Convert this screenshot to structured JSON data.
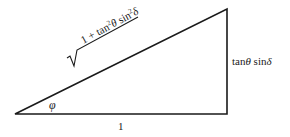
{
  "diagram": {
    "type": "right-triangle",
    "vertices": {
      "left": [
        15,
        114
      ],
      "bottom_right": [
        227,
        114
      ],
      "top_right": [
        227,
        9
      ]
    },
    "stroke_color": "#1a1a1a",
    "labels": {
      "hypotenuse": {
        "radical": "√",
        "part1": "1 + tan",
        "exp1": "2",
        "theta": "θ",
        "part2": " sin",
        "exp2": "2",
        "delta": "δ"
      },
      "opposite": {
        "part1": "tan",
        "theta": "θ",
        "part2": " sin",
        "delta": "δ"
      },
      "adjacent": "1",
      "angle": "φ"
    }
  }
}
